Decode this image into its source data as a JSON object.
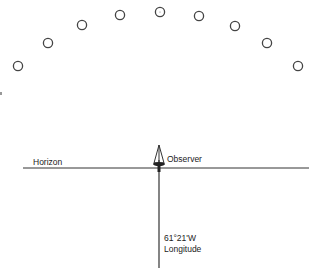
{
  "diagram": {
    "stars": [
      {
        "x": 18,
        "y": 66
      },
      {
        "x": 48,
        "y": 43
      },
      {
        "x": 82,
        "y": 25
      },
      {
        "x": 120,
        "y": 15
      },
      {
        "x": 160,
        "y": 12
      },
      {
        "x": 199,
        "y": 16
      },
      {
        "x": 235,
        "y": 26
      },
      {
        "x": 267,
        "y": 43
      },
      {
        "x": 298,
        "y": 66
      }
    ],
    "labels": {
      "horizon": "Horizon",
      "observer": "Observer",
      "longitude_value": "61°21'W",
      "longitude": "Longitude"
    },
    "colors": {
      "line": "#333333",
      "star": "#444444"
    }
  }
}
